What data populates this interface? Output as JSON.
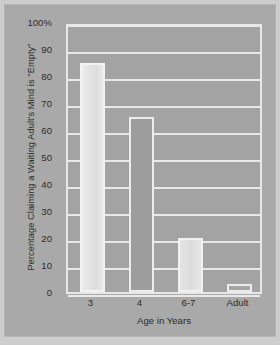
{
  "chart_data": {
    "type": "bar",
    "title": "",
    "xlabel": "Age in Years",
    "ylabel": "Percentage Claiming a Waiting Adult's Mind is \"Empty\"",
    "categories": [
      "3",
      "4",
      "6-7",
      "Adult"
    ],
    "values": [
      85,
      65,
      20,
      3
    ],
    "ylim": [
      0,
      100
    ],
    "yticks": [
      {
        "value": 100,
        "label": "100%"
      },
      {
        "value": 90,
        "label": "90"
      },
      {
        "value": 80,
        "label": "80"
      },
      {
        "value": 70,
        "label": "70"
      },
      {
        "value": 60,
        "label": "60"
      },
      {
        "value": 50,
        "label": "50"
      },
      {
        "value": 40,
        "label": "40"
      },
      {
        "value": 30,
        "label": "30"
      },
      {
        "value": 20,
        "label": "20"
      },
      {
        "value": 10,
        "label": "10"
      },
      {
        "value": 0,
        "label": "0"
      }
    ],
    "grid": true,
    "legend": "none",
    "colors": {
      "figure_background": "#cdcdcd",
      "canvas_background": "#a9a9a9",
      "plot_background": "#a3a3a3",
      "gridline": "#e9e9e9",
      "bar_light": "#e6e6e6",
      "bar_dark": "#9d9d9d",
      "text": "#2b2b2b"
    }
  }
}
